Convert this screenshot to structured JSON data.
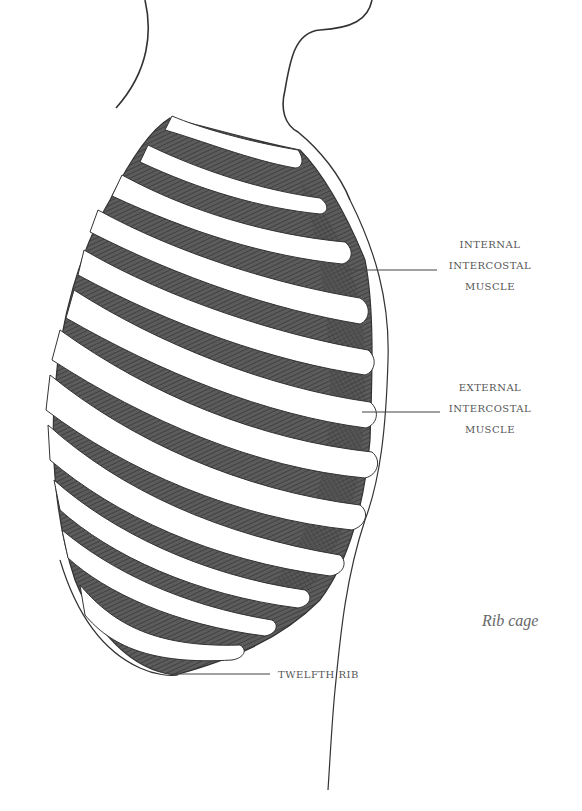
{
  "figure": {
    "caption": "Rib cage",
    "colors": {
      "muscle_fill": "#5a5a5a",
      "hatch": "#2e2e2e",
      "rib": "#ffffff",
      "outline": "#333333",
      "label_text": "#555555",
      "leader_line": "#444444"
    }
  },
  "labels": {
    "internal_intercostal": {
      "line1": "INTERNAL",
      "line2": "INTERCOSTAL",
      "line3": "MUSCLE"
    },
    "external_intercostal": {
      "line1": "EXTERNAL",
      "line2": "INTERCOSTAL",
      "line3": "MUSCLE"
    },
    "twelfth_rib": "TWELFTH RIB"
  }
}
